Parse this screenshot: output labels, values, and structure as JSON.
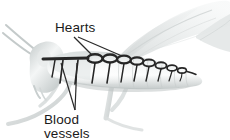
{
  "figure": {
    "background_color": "#ffffff",
    "width": 230,
    "height": 140
  },
  "labels": [
    {
      "id": "hearts",
      "text": "Hearts",
      "x": 55,
      "y": 32,
      "points_to": [
        "dorsal-heart-chamber-1",
        "dorsal-heart-chamber-4"
      ]
    },
    {
      "id": "blood-vessels-line1",
      "text": "Blood",
      "x": 44,
      "y": 124,
      "points_to": [
        "blood-vessel-2",
        "blood-vessel-3"
      ]
    },
    {
      "id": "blood-vessels-line2",
      "text": "vessels",
      "x": 44,
      "y": 138,
      "points_to": []
    }
  ],
  "colors": {
    "label_text": "#1a1a1a",
    "leader_line": "#2a2a2a",
    "vessel_dark": "#262626",
    "body_light": "#e9ecec",
    "body_mid": "#cfd4d4",
    "body_shadow": "#b9bfbf",
    "wing_tint": "#e4e7e7",
    "highlight": "#fbfcfc"
  },
  "anatomy": {
    "heart_chamber_count": 8,
    "blood_vessel_count": 9,
    "antenna_count": 2,
    "visible_leg_count": 3,
    "wing_count": 1,
    "aorta_label": "dorsal aorta",
    "parts": [
      "antennae",
      "head",
      "thorax",
      "wing",
      "abdomen",
      "dorsal-aorta",
      "heart-chambers",
      "blood-vessels",
      "front-leg",
      "middle-leg",
      "hind-leg"
    ]
  }
}
